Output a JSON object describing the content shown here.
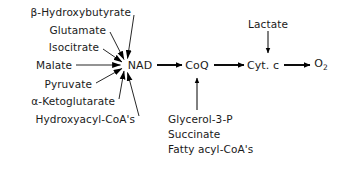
{
  "diagram": {
    "background_color": "#ffffff",
    "line_color": "#000000",
    "text_color": "#1a1a1a",
    "chain": {
      "nodes": [
        {
          "id": "nad",
          "label": "NAD",
          "x": 140,
          "y": 65
        },
        {
          "id": "coq",
          "label": "CoQ",
          "x": 197,
          "y": 65
        },
        {
          "id": "cytc",
          "label": "Cyt. c",
          "x": 263,
          "y": 65
        },
        {
          "id": "o2",
          "label": "O",
          "subscript": "2",
          "x": 321,
          "y": 65
        }
      ]
    },
    "nad_substrates": [
      {
        "label": "β-Hydroxybutyrate",
        "x": 131,
        "y": 12
      },
      {
        "label": "Glutamate",
        "x": 106,
        "y": 30
      },
      {
        "label": "Isocitrate",
        "x": 99,
        "y": 47
      },
      {
        "label": "Malate",
        "x": 72,
        "y": 65
      },
      {
        "label": "Pyruvate",
        "x": 92,
        "y": 84
      },
      {
        "label": "α-Ketoglutarate",
        "x": 115,
        "y": 101
      },
      {
        "label": "Hydroxyacyl-CoA's",
        "x": 135,
        "y": 119
      }
    ],
    "coq_donors": [
      {
        "label": "Glycerol-3-P",
        "x": 168,
        "y": 119
      },
      {
        "label": "Succinate",
        "x": 168,
        "y": 134
      },
      {
        "label": "Fatty acyl-CoA's",
        "x": 168,
        "y": 149
      }
    ],
    "cytc_donor": {
      "label": "Lactate",
      "x": 268,
      "y": 24
    }
  }
}
